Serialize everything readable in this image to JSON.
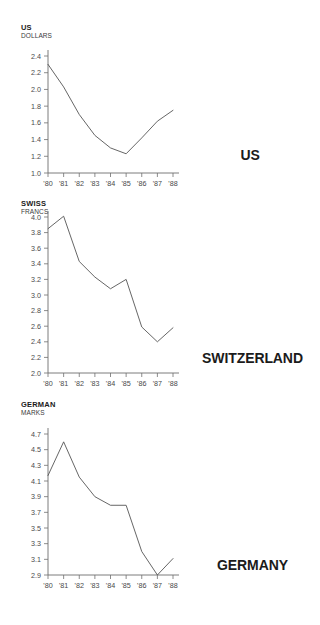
{
  "page": {
    "title": "Foreign Exchange Rates per US Dollar 1980-1988",
    "background_color": "#ffffff",
    "line_color": "#555555",
    "axis_color": "#6e6e6e",
    "text_color": "#1b1b1b"
  },
  "panels": [
    {
      "id": "us",
      "unit_line1": "US",
      "unit_line2": "DOLLARS",
      "country": "US"
    },
    {
      "id": "swiss",
      "unit_line1": "SWISS",
      "unit_line2": "FRANCS",
      "country": "SWITZERLAND"
    },
    {
      "id": "german",
      "unit_line1": "GERMAN",
      "unit_line2": "MARKS",
      "country": "GERMANY"
    }
  ],
  "chart_data": [
    {
      "type": "line",
      "title": "US DOLLARS",
      "series_name": "US",
      "xlabel": "",
      "ylabel": "US DOLLARS",
      "categories": [
        "'80",
        "'81",
        "'82",
        "'83",
        "'84",
        "'85",
        "'86",
        "'87",
        "'88"
      ],
      "x": [
        1980,
        1981,
        1982,
        1983,
        1984,
        1985,
        1986,
        1987,
        1988
      ],
      "values": [
        2.3,
        2.03,
        1.7,
        1.45,
        1.3,
        1.23,
        1.42,
        1.62,
        1.75
      ],
      "ylim": [
        1.0,
        2.4
      ],
      "yticks": [
        "1.0",
        "1.2",
        "1.4",
        "1.6",
        "1.8",
        "2.0",
        "2.2",
        "2.4"
      ],
      "ytick_values": [
        1.0,
        1.2,
        1.4,
        1.6,
        1.8,
        2.0,
        2.2,
        2.4
      ],
      "grid": false,
      "legend": "none"
    },
    {
      "type": "line",
      "title": "SWISS FRANCS",
      "series_name": "SWITZERLAND",
      "xlabel": "",
      "ylabel": "SWISS FRANCS",
      "categories": [
        "'80",
        "'81",
        "'82",
        "'83",
        "'84",
        "'85",
        "'86",
        "'87",
        "'88"
      ],
      "x": [
        1980,
        1981,
        1982,
        1983,
        1984,
        1985,
        1986,
        1987,
        1988
      ],
      "values": [
        3.85,
        4.01,
        3.43,
        3.23,
        3.08,
        3.2,
        2.59,
        2.4,
        2.58
      ],
      "ylim": [
        2.0,
        4.0
      ],
      "yticks": [
        "2.0",
        "2.2",
        "2.4",
        "2.6",
        "2.8",
        "3.0",
        "3.2",
        "3.4",
        "3.6",
        "3.8",
        "4.0"
      ],
      "ytick_values": [
        2.0,
        2.2,
        2.4,
        2.6,
        2.8,
        3.0,
        3.2,
        3.4,
        3.6,
        3.8,
        4.0
      ],
      "grid": false,
      "legend": "none"
    },
    {
      "type": "line",
      "title": "GERMAN MARKS",
      "series_name": "GERMANY",
      "xlabel": "",
      "ylabel": "GERMAN MARKS",
      "categories": [
        "'80",
        "'81",
        "'82",
        "'83",
        "'84",
        "'85",
        "'86",
        "'87",
        "'88"
      ],
      "x": [
        1980,
        1981,
        1982,
        1983,
        1984,
        1985,
        1986,
        1987,
        1988
      ],
      "values": [
        4.17,
        4.6,
        4.15,
        3.9,
        3.79,
        3.79,
        3.2,
        2.9,
        3.11
      ],
      "ylim": [
        2.9,
        4.7
      ],
      "yticks": [
        "2.9",
        "3.1",
        "3.3",
        "3.5",
        "3.7",
        "3.9",
        "4.1",
        "4.3",
        "4.5",
        "4.7"
      ],
      "ytick_values": [
        2.9,
        3.1,
        3.3,
        3.5,
        3.7,
        3.9,
        4.1,
        4.3,
        4.5,
        4.7
      ],
      "grid": false,
      "legend": "none"
    }
  ]
}
